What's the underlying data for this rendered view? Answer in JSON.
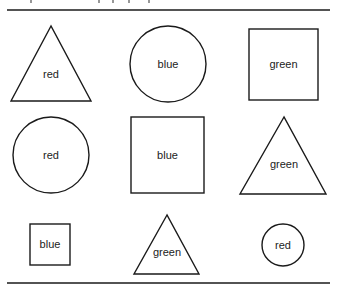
{
  "figure": {
    "rules": {
      "top_y": 10,
      "bottom_y": 283,
      "x1": 7,
      "x2": 330
    },
    "shapes": [
      {
        "id": "s1",
        "type": "triangle",
        "label": "red",
        "row": 1,
        "col": 1,
        "size": "large"
      },
      {
        "id": "s2",
        "type": "circle",
        "label": "blue",
        "row": 1,
        "col": 2,
        "size": "large"
      },
      {
        "id": "s3",
        "type": "square",
        "label": "green",
        "row": 1,
        "col": 3,
        "size": "large"
      },
      {
        "id": "s4",
        "type": "circle",
        "label": "red",
        "row": 2,
        "col": 1,
        "size": "large"
      },
      {
        "id": "s5",
        "type": "square",
        "label": "blue",
        "row": 2,
        "col": 2,
        "size": "large"
      },
      {
        "id": "s6",
        "type": "triangle",
        "label": "green",
        "row": 2,
        "col": 3,
        "size": "large"
      },
      {
        "id": "s7",
        "type": "square",
        "label": "blue",
        "row": 3,
        "col": 1,
        "size": "small"
      },
      {
        "id": "s8",
        "type": "triangle",
        "label": "green",
        "row": 3,
        "col": 2,
        "size": "small"
      },
      {
        "id": "s9",
        "type": "circle",
        "label": "red",
        "row": 3,
        "col": 3,
        "size": "small"
      }
    ],
    "colors": {
      "stroke": "#1a1a1a",
      "text": "#222222",
      "background": "#ffffff"
    }
  }
}
